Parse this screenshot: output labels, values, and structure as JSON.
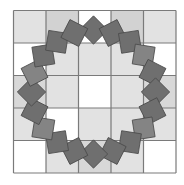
{
  "figure": {
    "width": 184,
    "height": 185,
    "grid": {
      "origin_x": 13.5,
      "origin_y": 10.5,
      "cell_size": 32.5,
      "rows": 5,
      "cols": 5,
      "line_color": "#7a7a7a",
      "fills": [
        [
          "#e2e2e2",
          "#d2d2d2",
          "#ffffff",
          "#d2d2d2",
          "#e2e2e2"
        ],
        [
          "#ffffff",
          "#e2e2e2",
          "#e2e2e2",
          "#e2e2e2",
          "#ffffff"
        ],
        [
          "#d8d8d8",
          "#e2e2e2",
          "#ffffff",
          "#e2e2e2",
          "#d8d8d8"
        ],
        [
          "#e2e2e2",
          "#ffffff",
          "#e2e2e2",
          "#e2e2e2",
          "#e2e2e2"
        ],
        [
          "#ffffff",
          "#e2e2e2",
          "#d8d8d8",
          "#e2e2e2",
          "#ffffff"
        ]
      ]
    },
    "ring": {
      "center_x": 93.5,
      "center_y": 92,
      "radius": 62,
      "count": 20,
      "square_size": 20,
      "fill": "#6f6f6f",
      "alt_fill": "#848484",
      "stroke": "#4a4a4a",
      "alt_indices": [
        3,
        7,
        13,
        16
      ]
    }
  }
}
